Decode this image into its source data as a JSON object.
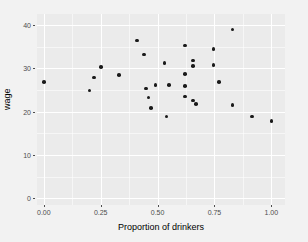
{
  "chart_data": {
    "type": "scatter",
    "title": "",
    "xlabel": "Proportion of drinkers",
    "ylabel": "wage",
    "xlim": [
      -0.03,
      1.06
    ],
    "ylim": [
      -1.5,
      42.5
    ],
    "xticks": [
      "0.00",
      "0.25",
      "0.50",
      "0.75",
      "1.00"
    ],
    "xtick_values": [
      0.0,
      0.25,
      0.5,
      0.75,
      1.0
    ],
    "yticks": [
      "0",
      "10",
      "20",
      "30",
      "40"
    ],
    "ytick_values": [
      0,
      10,
      20,
      30,
      40
    ],
    "grid": true,
    "legend": "none",
    "point_color": "#1a1a1a",
    "panel_color": "#ebebeb",
    "grid_color": "#ffffff",
    "page_color": "#f2f2f2",
    "points": [
      {
        "x": 0.0,
        "y": 26.8
      },
      {
        "x": 0.2,
        "y": 24.9
      },
      {
        "x": 0.22,
        "y": 27.9
      },
      {
        "x": 0.25,
        "y": 30.3
      },
      {
        "x": 0.33,
        "y": 28.5
      },
      {
        "x": 0.41,
        "y": 36.4
      },
      {
        "x": 0.44,
        "y": 33.2
      },
      {
        "x": 0.45,
        "y": 25.3
      },
      {
        "x": 0.46,
        "y": 23.3
      },
      {
        "x": 0.47,
        "y": 20.9
      },
      {
        "x": 0.49,
        "y": 26.2
      },
      {
        "x": 0.53,
        "y": 31.2
      },
      {
        "x": 0.54,
        "y": 18.9
      },
      {
        "x": 0.55,
        "y": 26.1
      },
      {
        "x": 0.62,
        "y": 35.2
      },
      {
        "x": 0.62,
        "y": 28.7
      },
      {
        "x": 0.62,
        "y": 25.9
      },
      {
        "x": 0.62,
        "y": 23.5
      },
      {
        "x": 0.655,
        "y": 31.8
      },
      {
        "x": 0.655,
        "y": 30.5
      },
      {
        "x": 0.655,
        "y": 22.6
      },
      {
        "x": 0.67,
        "y": 21.8
      },
      {
        "x": 0.745,
        "y": 34.5
      },
      {
        "x": 0.745,
        "y": 30.8
      },
      {
        "x": 0.77,
        "y": 26.9
      },
      {
        "x": 0.83,
        "y": 38.9
      },
      {
        "x": 0.83,
        "y": 21.5
      },
      {
        "x": 0.915,
        "y": 18.9
      },
      {
        "x": 1.0,
        "y": 17.8
      }
    ]
  }
}
